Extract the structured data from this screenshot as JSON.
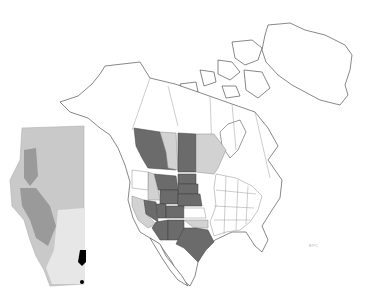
{
  "map": {
    "type": "species-range-map",
    "region": "North America",
    "legend_shades": {
      "dark_range": "#6b6b6b",
      "light_range": "#d2d2d2",
      "outside_range": "#ffffff"
    },
    "dark_regions": [
      "British Columbia",
      "Saskatchewan",
      "Montana",
      "Wyoming",
      "North Dakota",
      "South Dakota",
      "Nebraska",
      "Nevada",
      "Utah",
      "Colorado",
      "Arizona",
      "New Mexico",
      "Texas"
    ],
    "light_regions": [
      "Alberta",
      "Manitoba",
      "Idaho",
      "California",
      "Oklahoma"
    ],
    "inset": {
      "name": "Alberta",
      "shading": "grey-relief",
      "marked_points_color": "#000000"
    },
    "scale_label": "EPC"
  }
}
